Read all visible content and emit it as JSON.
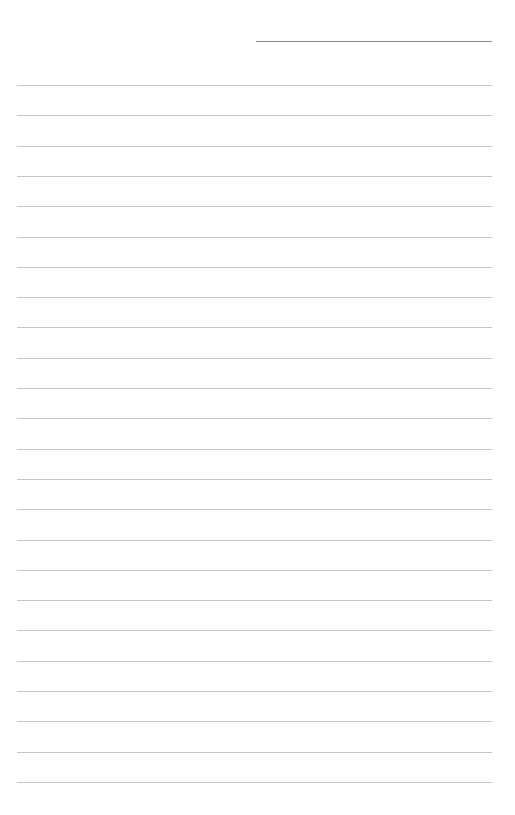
{
  "page": {
    "type": "ruled-notebook-page",
    "header_line": {
      "label": "",
      "color": "#8a8a8a"
    },
    "rule_color": "#c4c4c4",
    "rule_count": 24,
    "rules": [
      {
        "index": 1,
        "text": ""
      },
      {
        "index": 2,
        "text": ""
      },
      {
        "index": 3,
        "text": ""
      },
      {
        "index": 4,
        "text": ""
      },
      {
        "index": 5,
        "text": ""
      },
      {
        "index": 6,
        "text": ""
      },
      {
        "index": 7,
        "text": ""
      },
      {
        "index": 8,
        "text": ""
      },
      {
        "index": 9,
        "text": ""
      },
      {
        "index": 10,
        "text": ""
      },
      {
        "index": 11,
        "text": ""
      },
      {
        "index": 12,
        "text": ""
      },
      {
        "index": 13,
        "text": ""
      },
      {
        "index": 14,
        "text": ""
      },
      {
        "index": 15,
        "text": ""
      },
      {
        "index": 16,
        "text": ""
      },
      {
        "index": 17,
        "text": ""
      },
      {
        "index": 18,
        "text": ""
      },
      {
        "index": 19,
        "text": ""
      },
      {
        "index": 20,
        "text": ""
      },
      {
        "index": 21,
        "text": ""
      },
      {
        "index": 22,
        "text": ""
      },
      {
        "index": 23,
        "text": ""
      },
      {
        "index": 24,
        "text": ""
      }
    ]
  }
}
